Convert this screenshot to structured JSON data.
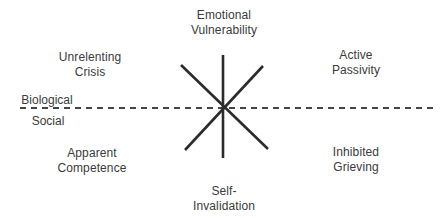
{
  "diagram": {
    "type": "dialectical-dilemmas-star",
    "colors": {
      "text": "#3a3a3a",
      "star_lines": "#2b2b2b",
      "divider": "#444444",
      "background": "#ffffff"
    },
    "divider": {
      "style": "dashed",
      "label_above": "Biological",
      "label_below": "Social"
    },
    "poles": {
      "top": {
        "line1": "Emotional",
        "line2": "Vulnerability"
      },
      "bottom": {
        "line1": "Self-",
        "line2": "Invalidation"
      },
      "upper_left": {
        "line1": "Unrelenting",
        "line2": "Crisis"
      },
      "upper_right": {
        "line1": "Active",
        "line2": "Passivity"
      },
      "lower_left": {
        "line1": "Apparent",
        "line2": "Competence"
      },
      "lower_right": {
        "line1": "Inhibited",
        "line2": "Grieving"
      }
    },
    "star": {
      "center": [
        223,
        108
      ],
      "spokes": [
        {
          "name": "vertical",
          "from": [
            223,
            55
          ],
          "to": [
            223,
            158
          ]
        },
        {
          "name": "diagonal-nw-se",
          "from": [
            181,
            65
          ],
          "to": [
            268,
            149
          ]
        },
        {
          "name": "diagonal-ne-sw",
          "from": [
            263,
            66
          ],
          "to": [
            185,
            150
          ]
        }
      ]
    }
  }
}
